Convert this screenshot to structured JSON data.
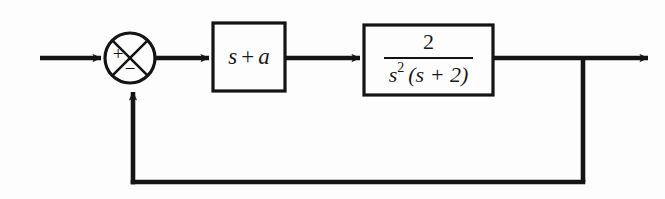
{
  "diagram": {
    "type": "control-system-block-diagram",
    "background_color": "#fdfdfd",
    "line_color": "#141414",
    "summing_junction": {
      "name": "summing-junction",
      "shape": "circle-with-x",
      "center_x": 130,
      "center_y": 58,
      "radius": 25,
      "input_sign": "+",
      "feedback_sign": "−"
    },
    "blocks": [
      {
        "name": "controller-block",
        "label": "s + a",
        "label_parts": {
          "variable": "s",
          "operator": "+",
          "parameter": "a"
        },
        "x": 213,
        "y": 23,
        "width": 72,
        "height": 68
      },
      {
        "name": "plant-block",
        "label": "2 / s² (s + 2)",
        "numerator": "2",
        "denominator_base": "s",
        "denominator_exponent": "2",
        "denominator_factor": "(s + 2)",
        "x": 364,
        "y": 25,
        "width": 129,
        "height": 70
      }
    ],
    "signals": [
      {
        "name": "input-signal-arrow",
        "label": "",
        "from_x": 40,
        "to_x": 105,
        "y": 58
      },
      {
        "name": "error-signal-arrow",
        "label": "",
        "from_x": 155,
        "to_x": 213,
        "y": 58
      },
      {
        "name": "controller-output-arrow",
        "label": "",
        "from_x": 285,
        "to_x": 364,
        "y": 58
      },
      {
        "name": "output-signal-arrow",
        "label": "",
        "from_x": 493,
        "to_x": 652,
        "y": 58
      }
    ],
    "feedback_path": {
      "name": "feedback-path",
      "takeoff_x": 583,
      "takeoff_y": 58,
      "bottom_y": 182,
      "return_x": 133,
      "return_to_y": 86,
      "arrow_direction": "up-into-summing-junction"
    }
  }
}
